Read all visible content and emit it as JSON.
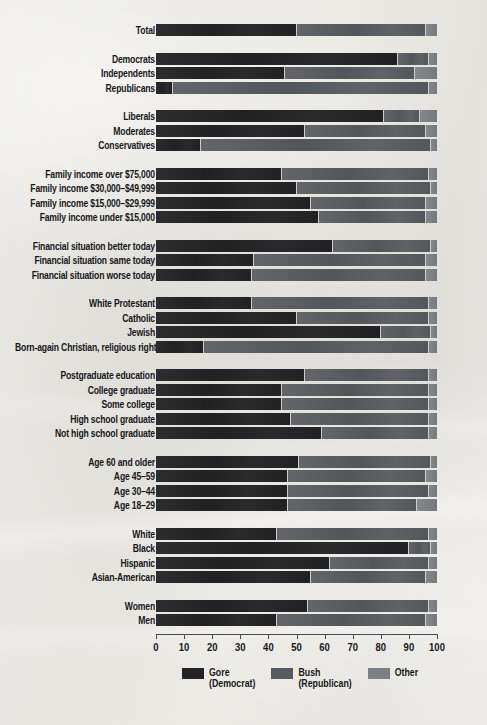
{
  "chart_data": {
    "type": "bar",
    "subtype": "stacked-horizontal-100",
    "title": "",
    "xlabel": "",
    "ylabel": "",
    "xlim": [
      0,
      100
    ],
    "xticks": [
      0,
      10,
      20,
      30,
      40,
      50,
      60,
      70,
      80,
      90,
      100
    ],
    "grid": false,
    "legend_position": "bottom",
    "series": [
      {
        "name": "Gore",
        "sub": "(Democrat)",
        "color": "#232326",
        "key": "gore"
      },
      {
        "name": "Bush",
        "sub": "(Republican)",
        "color": "#575a5e",
        "key": "bush"
      },
      {
        "name": "Other",
        "sub": "",
        "color": "#7b7e82",
        "key": "other"
      }
    ],
    "groups": [
      {
        "name": "total",
        "rows": [
          {
            "label": "Total",
            "gore": 50,
            "bush": 46,
            "other": 4
          }
        ]
      },
      {
        "name": "party",
        "rows": [
          {
            "label": "Democrats",
            "gore": 86,
            "bush": 11,
            "other": 3
          },
          {
            "label": "Independents",
            "gore": 46,
            "bush": 46,
            "other": 8
          },
          {
            "label": "Republicans",
            "gore": 6,
            "bush": 91,
            "other": 3
          }
        ]
      },
      {
        "name": "ideology",
        "rows": [
          {
            "label": "Liberals",
            "gore": 81,
            "bush": 13,
            "other": 6
          },
          {
            "label": "Moderates",
            "gore": 53,
            "bush": 43,
            "other": 4
          },
          {
            "label": "Conservatives",
            "gore": 16,
            "bush": 82,
            "other": 2
          }
        ]
      },
      {
        "name": "income",
        "rows": [
          {
            "label": "Family income over $75,000",
            "gore": 45,
            "bush": 52,
            "other": 3
          },
          {
            "label": "Family income $30,000–$49,999",
            "gore": 50,
            "bush": 48,
            "other": 2
          },
          {
            "label": "Family income $15,000–$29,999",
            "gore": 55,
            "bush": 41,
            "other": 4
          },
          {
            "label": "Family income under $15,000",
            "gore": 58,
            "bush": 38,
            "other": 4
          }
        ]
      },
      {
        "name": "financial-situation",
        "rows": [
          {
            "label": "Financial situation better today",
            "gore": 63,
            "bush": 35,
            "other": 2
          },
          {
            "label": "Financial situation same today",
            "gore": 35,
            "bush": 61,
            "other": 4
          },
          {
            "label": "Financial situation worse today",
            "gore": 34,
            "bush": 62,
            "other": 4
          }
        ]
      },
      {
        "name": "religion",
        "rows": [
          {
            "label": "White Protestant",
            "gore": 34,
            "bush": 63,
            "other": 3
          },
          {
            "label": "Catholic",
            "gore": 50,
            "bush": 47,
            "other": 3
          },
          {
            "label": "Jewish",
            "gore": 80,
            "bush": 18,
            "other": 2
          },
          {
            "label": "Born-again Christian, religious right",
            "gore": 17,
            "bush": 80,
            "other": 3
          }
        ]
      },
      {
        "name": "education",
        "rows": [
          {
            "label": "Postgraduate education",
            "gore": 53,
            "bush": 44,
            "other": 3
          },
          {
            "label": "College graduate",
            "gore": 45,
            "bush": 52,
            "other": 3
          },
          {
            "label": "Some college",
            "gore": 45,
            "bush": 52,
            "other": 3
          },
          {
            "label": "High school graduate",
            "gore": 48,
            "bush": 49,
            "other": 3
          },
          {
            "label": "Not high school graduate",
            "gore": 59,
            "bush": 38,
            "other": 3
          }
        ]
      },
      {
        "name": "age",
        "rows": [
          {
            "label": "Age 60 and older",
            "gore": 51,
            "bush": 47,
            "other": 2
          },
          {
            "label": "Age 45–59",
            "gore": 47,
            "bush": 49,
            "other": 4
          },
          {
            "label": "Age 30–44",
            "gore": 47,
            "bush": 50,
            "other": 3
          },
          {
            "label": "Age 18–29",
            "gore": 47,
            "bush": 46,
            "other": 7
          }
        ]
      },
      {
        "name": "race",
        "rows": [
          {
            "label": "White",
            "gore": 43,
            "bush": 54,
            "other": 3
          },
          {
            "label": "Black",
            "gore": 90,
            "bush": 8,
            "other": 2
          },
          {
            "label": "Hispanic",
            "gore": 62,
            "bush": 35,
            "other": 3
          },
          {
            "label": "Asian-American",
            "gore": 55,
            "bush": 41,
            "other": 4
          }
        ]
      },
      {
        "name": "gender",
        "rows": [
          {
            "label": "Women",
            "gore": 54,
            "bush": 43,
            "other": 3
          },
          {
            "label": "Men",
            "gore": 43,
            "bush": 53,
            "other": 4
          }
        ]
      }
    ]
  }
}
